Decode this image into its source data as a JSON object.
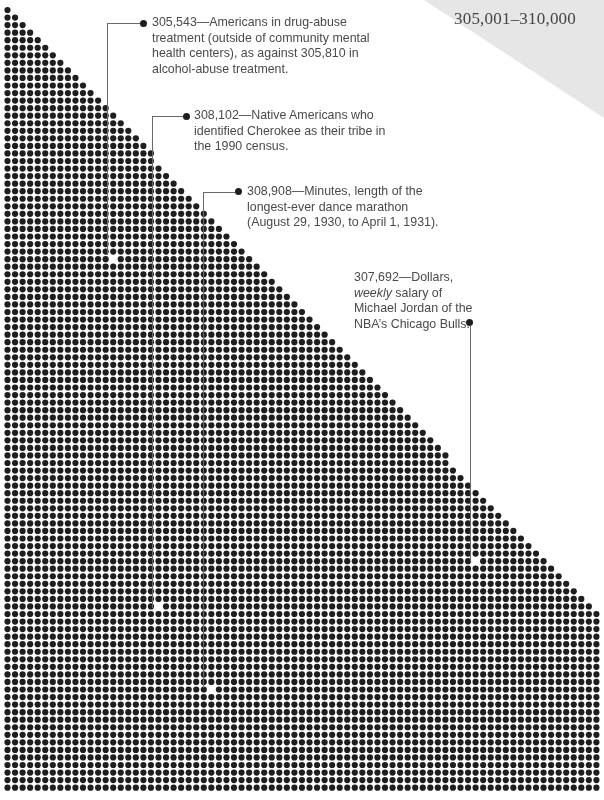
{
  "header": {
    "range_title": "305,001–310,000"
  },
  "callouts": [
    {
      "number": "305,543",
      "text": "305,543—Americans in drug-abuse treatment (outside of community mental health centers), as against 305,810 in alcohol-abuse treatment."
    },
    {
      "number": "308,102",
      "text": "308,102—Native Americans who identified Cherokee as their tribe in the 1990 census."
    },
    {
      "number": "308,908",
      "text": "308,908—Minutes, length of the longest-ever dance marathon (August 29, 1930, to April 1, 1931)."
    },
    {
      "number": "307,692",
      "text_pre": "307,692—Dollars, ",
      "text_em": "weekly",
      "text_post": " salary of Michael Jordan of the NBA’s Chicago Bulls."
    }
  ],
  "dot_field": {
    "dot_color": "#1e1e1e",
    "background": "#ffffff",
    "pitch": 7.55,
    "radius": 3.1,
    "origin_x": 7.5,
    "origin_y": 10,
    "columns": 79,
    "rows": 104,
    "triangle_full_width_row": 81,
    "gaps": [
      {
        "x": 114,
        "y": 258
      },
      {
        "x": 158,
        "y": 610
      },
      {
        "x": 210,
        "y": 690
      },
      {
        "x": 475,
        "y": 564
      }
    ]
  }
}
